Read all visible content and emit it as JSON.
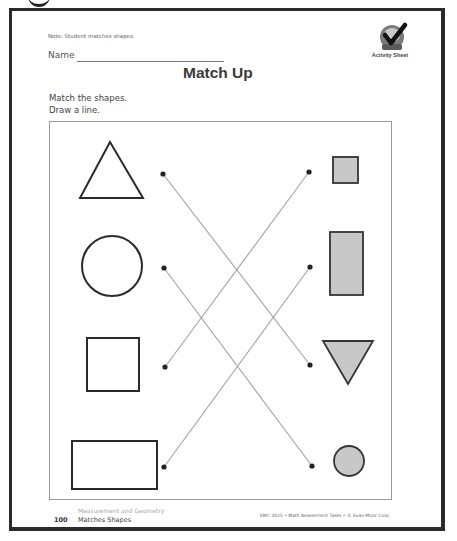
{
  "header": {
    "note": "Note: Student matches shapes.",
    "name_label": "Name",
    "title": "Match Up",
    "badge": {
      "icon": "checkmark-icon",
      "ribbon_text": "Daily",
      "label": "Activity Sheet"
    }
  },
  "instructions": {
    "line1": "Match the shapes.",
    "line2": "Draw a line."
  },
  "activity": {
    "left_shapes": [
      {
        "shape": "triangle",
        "fill": "none"
      },
      {
        "shape": "circle",
        "fill": "none"
      },
      {
        "shape": "square",
        "fill": "none"
      },
      {
        "shape": "rectangle",
        "fill": "none"
      }
    ],
    "right_shapes": [
      {
        "shape": "square",
        "fill": "#c8c8c8"
      },
      {
        "shape": "rectangle",
        "fill": "#c8c8c8"
      },
      {
        "shape": "triangle",
        "fill": "#c8c8c8"
      },
      {
        "shape": "circle",
        "fill": "#c8c8c8"
      }
    ],
    "matches": [
      {
        "from": "triangle",
        "to": "triangle"
      },
      {
        "from": "circle",
        "to": "circle"
      },
      {
        "from": "square",
        "to": "square"
      },
      {
        "from": "rectangle",
        "to": "rectangle"
      }
    ],
    "colors": {
      "outline": "#2a2a2a",
      "fill": "#c8c8c8",
      "line": "#a8a8a8",
      "dot": "#222222"
    }
  },
  "footer": {
    "category": "Measurement and Geometry",
    "page_number": "100",
    "topic": "Matches Shapes",
    "copyright": "EMC 3025 • Math Assessment Tasks • © Evan-Moor Corp."
  }
}
